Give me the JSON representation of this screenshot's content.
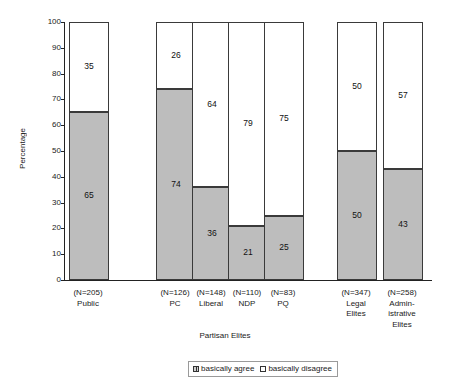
{
  "chart_data": {
    "type": "bar",
    "subtype": "stacked-percentage",
    "title": "",
    "xlabel": "Partisan Elites",
    "ylabel": "Percentage",
    "ylim": [
      0,
      100
    ],
    "yticks": [
      0,
      10,
      20,
      30,
      40,
      50,
      60,
      70,
      80,
      90,
      100
    ],
    "grid": false,
    "legend_position": "bottom-center",
    "categories": [
      "Public",
      "PC",
      "Liberal",
      "NDP",
      "PQ",
      "Legal Elites",
      "Administrative Elites"
    ],
    "category_lines": [
      [
        "Public"
      ],
      [
        "PC"
      ],
      [
        "Liberal"
      ],
      [
        "NDP"
      ],
      [
        "PQ"
      ],
      [
        "Legal",
        "Elites"
      ],
      [
        "Admin-",
        "istrative",
        "Elites"
      ]
    ],
    "sample_labels": [
      "(N=205)",
      "(N=126)",
      "(N=148)",
      "(N=110)",
      "(N=83)",
      "(N=347)",
      "(N=258)"
    ],
    "sample_sizes": [
      205,
      126,
      148,
      110,
      83,
      347,
      258
    ],
    "series": [
      {
        "name": "basically agree",
        "color": "#bdbdbd",
        "values": [
          65,
          74,
          36,
          21,
          25,
          50,
          43
        ]
      },
      {
        "name": "basically disagree",
        "color": "#ffffff",
        "values": [
          35,
          26,
          64,
          79,
          75,
          50,
          57
        ]
      }
    ],
    "group_label": "Partisan Elites",
    "group_members": [
      "PC",
      "Liberal",
      "NDP",
      "PQ"
    ]
  },
  "legend": {
    "items": [
      {
        "label": "basically agree",
        "swatch": "agree"
      },
      {
        "label": "basically disagree",
        "swatch": "disagree"
      }
    ]
  },
  "axis": {
    "y_title": "Percentage",
    "y_tick_labels": [
      "100",
      "90",
      "80",
      "70",
      "60",
      "50",
      "40",
      "30",
      "20",
      "10",
      "0"
    ],
    "x_group_label": "Partisan Elites"
  }
}
